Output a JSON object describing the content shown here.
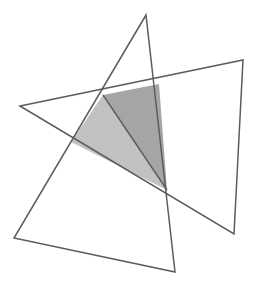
{
  "figure": {
    "canvas": {
      "width": 262,
      "height": 292,
      "background": "#ffffff"
    },
    "stroke_color": "#5c5c5c",
    "stroke_width": 1.5,
    "shapes": [
      {
        "name": "triangle-a",
        "label": "Triangle A",
        "fill": "none",
        "stroke": "#5c5c5c",
        "points": "146,15 14,238 175,272",
        "vertices": [
          {
            "label": "A1",
            "x": 146,
            "y": 15
          },
          {
            "label": "A2",
            "x": 14,
            "y": 238
          },
          {
            "label": "A3",
            "x": 175,
            "y": 272
          }
        ]
      },
      {
        "name": "triangle-b",
        "label": "Triangle B",
        "fill": "none",
        "stroke": "#5c5c5c",
        "points": "20,106 243,60 234,234",
        "vertices": [
          {
            "label": "B1",
            "x": 20,
            "y": 106
          },
          {
            "label": "B2",
            "x": 243,
            "y": 60
          },
          {
            "label": "B3",
            "x": 234,
            "y": 234
          }
        ]
      }
    ],
    "overlap": {
      "name": "intersection-quad",
      "label": "Intersection region",
      "points": "103,95 159,84 167,190 71,142",
      "vertices": [
        {
          "label": "P1",
          "x": 103,
          "y": 95
        },
        {
          "label": "P2",
          "x": 159,
          "y": 84
        },
        {
          "label": "P3",
          "x": 167,
          "y": 190
        },
        {
          "label": "P4",
          "x": 71,
          "y": 142
        }
      ],
      "divider": {
        "from": "103,95",
        "to": "167,190"
      },
      "faces": [
        {
          "name": "overlap-face-left",
          "label": "Left sub-triangle (light)",
          "points": "103,95 167,190 71,142",
          "fill": "#c6c6c6"
        },
        {
          "name": "overlap-face-right",
          "label": "Right sub-triangle (dark)",
          "points": "103,95 159,84 167,190",
          "fill": "#a9a9a9"
        }
      ]
    }
  }
}
